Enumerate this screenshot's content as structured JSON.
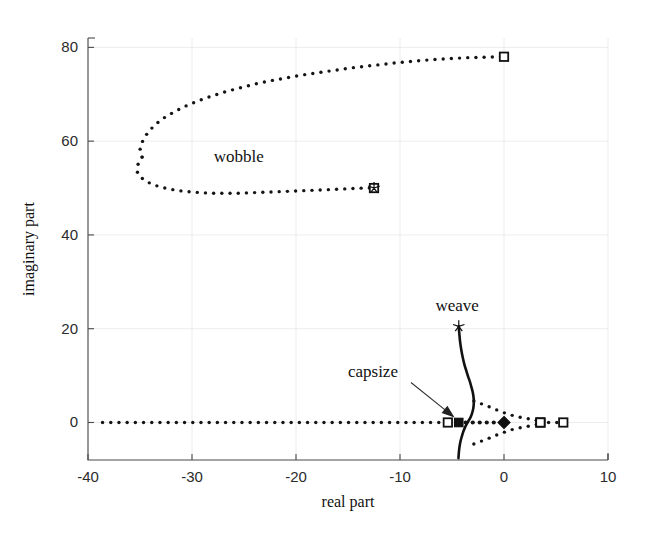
{
  "chart_data": {
    "type": "scatter",
    "title": "",
    "xlabel": "real part",
    "ylabel": "imaginary part",
    "xlim": [
      -40,
      10
    ],
    "ylim": [
      -8,
      82
    ],
    "xticks": [
      -40,
      -30,
      -20,
      -10,
      0,
      10
    ],
    "xticklabels": [
      "-40",
      "-30",
      "-20",
      "-10",
      "0",
      "10"
    ],
    "yticks": [
      0,
      20,
      40,
      60,
      80
    ],
    "yticklabels": [
      "0",
      "20",
      "40",
      "60",
      "80"
    ],
    "grid": true,
    "legend": "none",
    "annotations": [
      {
        "text": "wobble",
        "x": -25.5,
        "y": 55.5,
        "arrow": false
      },
      {
        "text": "weave",
        "x": -4.5,
        "y": 23.8,
        "arrow": false
      },
      {
        "text": "capsize",
        "x": -12.6,
        "y": 9.6,
        "arrow": true,
        "arrow_to_x": -4.6,
        "arrow_to_y": 0.8
      }
    ],
    "series": [
      {
        "name": "wobble-upper-branch",
        "style": "dotted",
        "points": [
          [
            -34.8,
            56.6
          ],
          [
            -35.0,
            58.4
          ],
          [
            -34.7,
            60.3
          ],
          [
            -34.2,
            62.0
          ],
          [
            -33.5,
            63.6
          ],
          [
            -32.6,
            65.1
          ],
          [
            -31.6,
            66.4
          ],
          [
            -30.5,
            67.6
          ],
          [
            -29.3,
            68.7
          ],
          [
            -28.0,
            69.7
          ],
          [
            -26.7,
            70.6
          ],
          [
            -25.3,
            71.4
          ],
          [
            -23.9,
            72.2
          ],
          [
            -22.4,
            72.9
          ],
          [
            -20.9,
            73.5
          ],
          [
            -19.4,
            74.1
          ],
          [
            -17.9,
            74.6
          ],
          [
            -16.3,
            75.1
          ],
          [
            -14.8,
            75.6
          ],
          [
            -13.2,
            76.0
          ],
          [
            -11.6,
            76.4
          ],
          [
            -10.0,
            76.8
          ],
          [
            -8.4,
            77.1
          ],
          [
            -6.8,
            77.4
          ],
          [
            -5.2,
            77.6
          ],
          [
            -3.6,
            77.8
          ],
          [
            -2.0,
            77.9
          ],
          [
            0.0,
            78.0
          ]
        ],
        "end_marker": {
          "type": "open-square",
          "x": 0.0,
          "y": 78.0
        }
      },
      {
        "name": "wobble-lower-branch",
        "style": "dotted",
        "points": [
          [
            -34.8,
            56.6
          ],
          [
            -35.2,
            55.0
          ],
          [
            -35.3,
            53.6
          ],
          [
            -35.0,
            52.4
          ],
          [
            -34.4,
            51.4
          ],
          [
            -33.6,
            50.6
          ],
          [
            -32.6,
            50.0
          ],
          [
            -31.5,
            49.5
          ],
          [
            -30.3,
            49.2
          ],
          [
            -29.1,
            49.0
          ],
          [
            -27.9,
            48.9
          ],
          [
            -26.7,
            48.9
          ],
          [
            -25.5,
            48.9
          ],
          [
            -24.3,
            49.0
          ],
          [
            -23.1,
            49.1
          ],
          [
            -21.9,
            49.2
          ],
          [
            -20.8,
            49.3
          ],
          [
            -19.7,
            49.4
          ],
          [
            -18.6,
            49.5
          ],
          [
            -17.5,
            49.6
          ],
          [
            -16.5,
            49.7
          ],
          [
            -15.5,
            49.8
          ],
          [
            -14.5,
            49.9
          ],
          [
            -13.5,
            50.0
          ],
          [
            -12.5,
            50.0
          ]
        ],
        "end_marker": {
          "type": "star-on-square",
          "x": -12.5,
          "y": 50.0
        }
      },
      {
        "name": "weave-solid-branch",
        "style": "solid",
        "points": [
          [
            -4.35,
            20.5
          ],
          [
            -4.3,
            19.0
          ],
          [
            -4.22,
            17.2
          ],
          [
            -4.1,
            15.4
          ],
          [
            -3.96,
            13.8
          ],
          [
            -3.8,
            12.3
          ],
          [
            -3.62,
            11.0
          ],
          [
            -3.45,
            9.8
          ],
          [
            -3.28,
            8.7
          ],
          [
            -3.14,
            7.6
          ],
          [
            -3.02,
            6.6
          ],
          [
            -2.94,
            5.6
          ],
          [
            -2.9,
            4.6
          ],
          [
            -2.92,
            3.6
          ],
          [
            -2.98,
            2.7
          ],
          [
            -3.08,
            1.9
          ],
          [
            -3.22,
            1.1
          ],
          [
            -3.4,
            0.4
          ],
          [
            -3.58,
            -0.3
          ],
          [
            -3.76,
            -1.1
          ],
          [
            -3.92,
            -2.0
          ],
          [
            -4.06,
            -3.0
          ],
          [
            -4.18,
            -4.0
          ],
          [
            -4.28,
            -5.2
          ],
          [
            -4.34,
            -6.4
          ],
          [
            -4.38,
            -7.6
          ]
        ],
        "end_marker": {
          "type": "star",
          "x": -4.35,
          "y": 20.5
        }
      },
      {
        "name": "weave-dotted-upper-branch",
        "style": "dotted",
        "points": [
          [
            -2.9,
            4.6
          ],
          [
            -2.7,
            4.4
          ],
          [
            -2.45,
            4.2
          ],
          [
            -2.2,
            4.0
          ],
          [
            -1.95,
            3.8
          ],
          [
            -1.7,
            3.58
          ],
          [
            -1.45,
            3.36
          ],
          [
            -1.2,
            3.14
          ],
          [
            -0.95,
            2.92
          ],
          [
            -0.7,
            2.68
          ],
          [
            -0.42,
            2.44
          ],
          [
            -0.14,
            2.2
          ],
          [
            0.16,
            1.96
          ],
          [
            0.48,
            1.72
          ],
          [
            0.82,
            1.5
          ],
          [
            1.18,
            1.3
          ],
          [
            1.56,
            1.12
          ],
          [
            1.96,
            0.96
          ],
          [
            2.36,
            0.8
          ],
          [
            2.74,
            0.64
          ],
          [
            3.06,
            0.48
          ],
          [
            3.3,
            0.32
          ],
          [
            3.44,
            0.16
          ],
          [
            3.5,
            0.0
          ]
        ],
        "end_marker": {
          "type": "open-square",
          "x": 3.5,
          "y": 0.0
        }
      },
      {
        "name": "weave-dotted-lower-branch",
        "style": "dotted",
        "points": [
          [
            -2.9,
            -4.6
          ],
          [
            -2.7,
            -4.4
          ],
          [
            -2.45,
            -4.2
          ],
          [
            -2.2,
            -4.0
          ],
          [
            -1.95,
            -3.8
          ],
          [
            -1.7,
            -3.58
          ],
          [
            -1.45,
            -3.36
          ],
          [
            -1.2,
            -3.14
          ],
          [
            -0.95,
            -2.92
          ],
          [
            -0.7,
            -2.68
          ],
          [
            -0.42,
            -2.44
          ],
          [
            -0.14,
            -2.2
          ],
          [
            0.16,
            -1.96
          ],
          [
            0.48,
            -1.72
          ],
          [
            0.82,
            -1.5
          ],
          [
            1.18,
            -1.3
          ],
          [
            1.56,
            -1.12
          ],
          [
            1.96,
            -0.96
          ],
          [
            2.36,
            -0.8
          ],
          [
            2.74,
            -0.64
          ],
          [
            3.06,
            -0.48
          ],
          [
            3.3,
            -0.32
          ],
          [
            3.44,
            -0.16
          ],
          [
            3.5,
            0.0
          ]
        ],
        "end_marker": {
          "type": "open-square",
          "x": 3.5,
          "y": 0.0
        }
      },
      {
        "name": "castering-real-axis-branch",
        "style": "dotted",
        "points": [
          [
            -38.6,
            0.0
          ],
          [
            -37.2,
            0.0
          ],
          [
            -35.6,
            0.0
          ],
          [
            -34.0,
            0.0
          ],
          [
            -32.4,
            0.0
          ],
          [
            -30.8,
            0.0
          ],
          [
            -29.2,
            0.0
          ],
          [
            -27.8,
            0.0
          ],
          [
            -26.4,
            0.0
          ],
          [
            -25.0,
            0.0
          ],
          [
            -23.7,
            0.0
          ],
          [
            -22.4,
            0.0
          ],
          [
            -21.2,
            0.0
          ],
          [
            -20.0,
            0.0
          ],
          [
            -18.9,
            0.0
          ],
          [
            -17.8,
            0.0
          ],
          [
            -16.8,
            0.0
          ],
          [
            -15.8,
            0.0
          ],
          [
            -14.9,
            0.0
          ],
          [
            -14.0,
            0.0
          ],
          [
            -13.2,
            0.0
          ],
          [
            -12.4,
            0.0
          ],
          [
            -11.7,
            0.0
          ],
          [
            -11.0,
            0.0
          ],
          [
            -10.4,
            0.0
          ],
          [
            -9.8,
            0.0
          ],
          [
            -9.2,
            0.0
          ],
          [
            -8.7,
            0.0
          ],
          [
            -8.2,
            0.0
          ],
          [
            -7.8,
            0.0
          ],
          [
            -7.4,
            0.0
          ],
          [
            -7.0,
            0.0
          ],
          [
            -6.7,
            0.0
          ],
          [
            -6.4,
            0.0
          ],
          [
            -6.1,
            0.0
          ],
          [
            -5.85,
            0.0
          ],
          [
            -5.6,
            0.0
          ],
          [
            -5.4,
            0.0
          ]
        ],
        "end_marker": {
          "type": "open-square",
          "x": -5.4,
          "y": 0.0
        }
      },
      {
        "name": "capsize-real-axis-branch",
        "style": "dotted-heavy",
        "points": [
          [
            -4.35,
            0.0
          ],
          [
            -4.05,
            0.0
          ],
          [
            -3.7,
            0.0
          ],
          [
            -3.3,
            0.0
          ],
          [
            -2.9,
            0.0
          ],
          [
            -2.5,
            0.0
          ],
          [
            -2.1,
            0.0
          ],
          [
            -1.7,
            0.0
          ],
          [
            -1.3,
            0.0
          ],
          [
            -0.9,
            0.0
          ],
          [
            -0.5,
            0.0
          ],
          [
            -0.15,
            0.0
          ],
          [
            0.0,
            0.0
          ]
        ],
        "start_marker": {
          "type": "filled-square",
          "x": -4.35,
          "y": 0.0
        },
        "end_marker": {
          "type": "filled-diamond",
          "x": 0.0,
          "y": 0.0
        }
      },
      {
        "name": "capsize-stable-real-axis-branch",
        "style": "dotted",
        "points": [
          [
            3.5,
            0.0
          ],
          [
            4.2,
            0.0
          ],
          [
            5.0,
            0.0
          ],
          [
            5.7,
            0.0
          ]
        ],
        "end_marker": {
          "type": "open-square",
          "x": 5.7,
          "y": 0.0
        }
      }
    ]
  },
  "axes": {
    "xlabel": "real part",
    "ylabel": "imaginary part"
  },
  "labels": {
    "wobble": "wobble",
    "weave": "weave",
    "capsize": "capsize"
  },
  "colors": {
    "ink": "#111111",
    "axis": "#4a4a4a",
    "grid": "#ececec",
    "background": "#ffffff"
  }
}
